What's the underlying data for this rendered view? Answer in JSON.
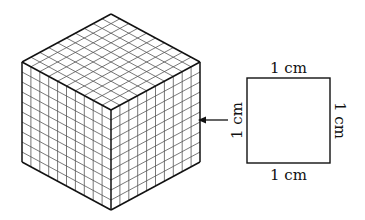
{
  "diagram": {
    "cube": {
      "divisions": 10,
      "vertices": {
        "top": [
          111,
          14
        ],
        "left_top": [
          22,
          62
        ],
        "right_top": [
          200,
          62
        ],
        "center": [
          111,
          110
        ],
        "left_bottom": [
          22,
          162
        ],
        "right_bottom": [
          200,
          162
        ],
        "bottom": [
          111,
          210
        ]
      }
    },
    "square": {
      "x": 247,
      "y": 78,
      "width": 83,
      "height": 85,
      "labels": {
        "top": "1 cm",
        "bottom": "1 cm",
        "left": "1 cm",
        "right": "1 cm"
      }
    },
    "arrow": {
      "from": [
        228,
        120
      ],
      "to": [
        198,
        120
      ]
    },
    "colors": {
      "outline": "#111111",
      "grid": "#555555"
    }
  }
}
